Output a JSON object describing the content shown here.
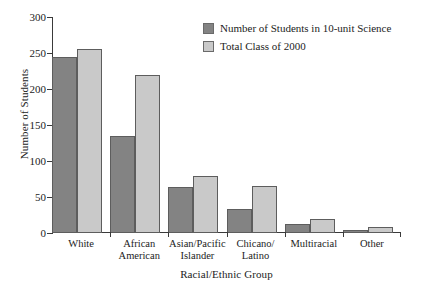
{
  "chart_data": {
    "type": "bar",
    "title": "",
    "xlabel": "Racial/Ethnic Group",
    "ylabel": "Number of Students",
    "ylim": [
      0,
      300
    ],
    "yticks": [
      0,
      50,
      100,
      150,
      200,
      250,
      300
    ],
    "ytick_labels": [
      "0",
      "50",
      "100",
      "150",
      "200",
      "250",
      "300"
    ],
    "grid": false,
    "legend_position": "top-right",
    "categories": [
      "White",
      "African\nAmerican",
      "Asian/Pacific\nIslander",
      "Chicano/\nLatino",
      "Multiracial",
      "Other"
    ],
    "series": [
      {
        "name": "Number of Students in 10-unit Science",
        "color": "#838383",
        "values": [
          245,
          135,
          64,
          34,
          12,
          4
        ]
      },
      {
        "name": "Total Class of 2000",
        "color": "#c9c9c9",
        "values": [
          256,
          220,
          79,
          65,
          20,
          9
        ]
      }
    ]
  },
  "legend": {
    "items": [
      {
        "label": "Number of Students in 10-unit Science"
      },
      {
        "label": "Total Class of 2000"
      }
    ]
  },
  "axes": {
    "y_title": "Number of Students",
    "x_title": "Racial/Ethnic Group"
  }
}
